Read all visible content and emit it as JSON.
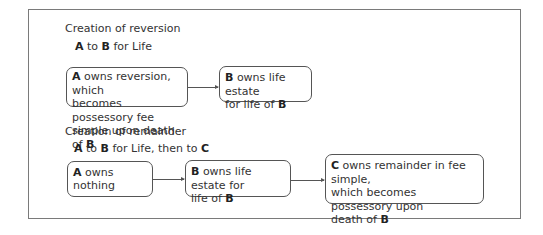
{
  "reversion": {
    "heading": "Creation of reversion",
    "grant": {
      "a": "A",
      "to": " to ",
      "b": "B",
      "rest": " for Life"
    },
    "box1": {
      "bold": "A",
      "line1": " owns reversion, which",
      "line2": "becomes possessory fee",
      "line3": "simple upon death of ",
      "bold2": "B"
    },
    "box2": {
      "bold": "B",
      "line1": " owns life estate",
      "line2": "for life of ",
      "bold2": "B"
    }
  },
  "remainder": {
    "heading": "Creation of remainder",
    "grant": {
      "a": "A",
      "to": " to ",
      "b": "B",
      "mid": " for Life, then to ",
      "c": "C"
    },
    "box1": {
      "bold": "A",
      "line1": " owns nothing"
    },
    "box2": {
      "bold": "B",
      "line1": " owns life estate for",
      "line2": "life of ",
      "bold2": "B"
    },
    "box3": {
      "bold": "C",
      "line1": " owns remainder in fee simple,",
      "line2": "which becomes possessory upon",
      "line3": "death of ",
      "bold2": "B"
    }
  }
}
